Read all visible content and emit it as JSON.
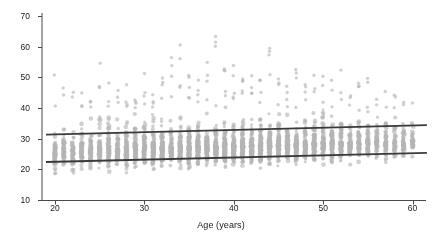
{
  "chart_data": {
    "type": "scatter",
    "title": "",
    "xlabel": "Age (years)",
    "ylabel": "Body mass index (kg/m²)",
    "xlim": [
      18.5,
      61.5
    ],
    "ylim": [
      10,
      71
    ],
    "xticks": [
      20,
      30,
      40,
      50,
      60
    ],
    "xtick_labels": [
      "20",
      "30",
      "40",
      "50",
      "60"
    ],
    "yticks": [
      10,
      20,
      30,
      40,
      50,
      60,
      70
    ],
    "ytick_labels": [
      "10",
      "20",
      "30",
      "40",
      "50",
      "60",
      "70"
    ],
    "grid": false,
    "legend": null,
    "marker": {
      "shape": "circle",
      "color": "#b4b4b4",
      "size_px": 2.0,
      "opacity": 0.62
    },
    "series": [
      {
        "name": "Participants",
        "description": "BMI of individual participants plotted against age in whole years; one vertical column of points per integer age from 20 to 60.",
        "x_grouping": "integer ages 20-60",
        "y_range_observed": [
          14.0,
          65.5
        ],
        "y_dense_band": [
          22.5,
          31.5
        ],
        "points_per_age_column_typical": 95,
        "columns": [
          {
            "age": 20,
            "n": 58,
            "ymin": 16.2,
            "ymax": 53.0,
            "median": 25.6
          },
          {
            "age": 21,
            "n": 54,
            "ymin": 16.4,
            "ymax": 50.1,
            "median": 25.7
          },
          {
            "age": 22,
            "n": 62,
            "ymin": 16.0,
            "ymax": 45.6,
            "median": 25.8
          },
          {
            "age": 23,
            "n": 66,
            "ymin": 15.9,
            "ymax": 47.2,
            "median": 25.9
          },
          {
            "age": 24,
            "n": 70,
            "ymin": 16.1,
            "ymax": 46.0,
            "median": 26.0
          },
          {
            "age": 25,
            "n": 78,
            "ymin": 15.6,
            "ymax": 55.4,
            "median": 26.1
          },
          {
            "age": 26,
            "n": 82,
            "ymin": 15.8,
            "ymax": 49.5,
            "median": 26.2
          },
          {
            "age": 27,
            "n": 88,
            "ymin": 15.4,
            "ymax": 46.9,
            "median": 26.3
          },
          {
            "age": 28,
            "n": 92,
            "ymin": 15.2,
            "ymax": 48.1,
            "median": 26.4
          },
          {
            "age": 29,
            "n": 96,
            "ymin": 15.0,
            "ymax": 45.0,
            "median": 26.4
          },
          {
            "age": 30,
            "n": 104,
            "ymin": 14.8,
            "ymax": 57.0,
            "median": 26.5
          },
          {
            "age": 31,
            "n": 98,
            "ymin": 15.1,
            "ymax": 46.4,
            "median": 26.6
          },
          {
            "age": 32,
            "n": 102,
            "ymin": 14.6,
            "ymax": 51.9,
            "median": 26.7
          },
          {
            "age": 33,
            "n": 108,
            "ymin": 14.2,
            "ymax": 58.3,
            "median": 26.8
          },
          {
            "age": 34,
            "n": 112,
            "ymin": 14.9,
            "ymax": 63.5,
            "median": 26.9
          },
          {
            "age": 35,
            "n": 118,
            "ymin": 15.3,
            "ymax": 50.8,
            "median": 27.0
          },
          {
            "age": 36,
            "n": 114,
            "ymin": 15.0,
            "ymax": 52.6,
            "median": 27.0
          },
          {
            "age": 37,
            "n": 110,
            "ymin": 15.5,
            "ymax": 57.2,
            "median": 27.1
          },
          {
            "age": 38,
            "n": 116,
            "ymin": 14.7,
            "ymax": 64.8,
            "median": 27.2
          },
          {
            "age": 39,
            "n": 120,
            "ymin": 15.2,
            "ymax": 53.4,
            "median": 27.3
          },
          {
            "age": 40,
            "n": 122,
            "ymin": 14.4,
            "ymax": 61.0,
            "median": 27.4
          },
          {
            "age": 41,
            "n": 118,
            "ymin": 15.0,
            "ymax": 49.7,
            "median": 27.4
          },
          {
            "age": 42,
            "n": 114,
            "ymin": 15.4,
            "ymax": 55.1,
            "median": 27.5
          },
          {
            "age": 43,
            "n": 110,
            "ymin": 15.1,
            "ymax": 50.3,
            "median": 27.6
          },
          {
            "age": 44,
            "n": 106,
            "ymin": 14.9,
            "ymax": 63.8,
            "median": 27.7
          },
          {
            "age": 45,
            "n": 104,
            "ymin": 15.6,
            "ymax": 52.0,
            "median": 27.8
          },
          {
            "age": 46,
            "n": 100,
            "ymin": 15.3,
            "ymax": 48.6,
            "median": 27.8
          },
          {
            "age": 47,
            "n": 96,
            "ymin": 15.8,
            "ymax": 54.3,
            "median": 27.9
          },
          {
            "age": 48,
            "n": 92,
            "ymin": 15.5,
            "ymax": 47.8,
            "median": 28.0
          },
          {
            "age": 49,
            "n": 88,
            "ymin": 16.0,
            "ymax": 50.9,
            "median": 28.1
          },
          {
            "age": 50,
            "n": 90,
            "ymin": 15.7,
            "ymax": 55.8,
            "median": 28.2
          },
          {
            "age": 51,
            "n": 84,
            "ymin": 16.2,
            "ymax": 49.1,
            "median": 28.2
          },
          {
            "age": 52,
            "n": 80,
            "ymin": 16.4,
            "ymax": 52.7,
            "median": 28.3
          },
          {
            "age": 53,
            "n": 76,
            "ymin": 16.1,
            "ymax": 46.5,
            "median": 28.4
          },
          {
            "age": 54,
            "n": 72,
            "ymin": 16.6,
            "ymax": 48.9,
            "median": 28.5
          },
          {
            "age": 55,
            "n": 68,
            "ymin": 16.3,
            "ymax": 51.4,
            "median": 28.6
          },
          {
            "age": 56,
            "n": 62,
            "ymin": 16.8,
            "ymax": 45.7,
            "median": 28.6
          },
          {
            "age": 57,
            "n": 56,
            "ymin": 17.0,
            "ymax": 47.3,
            "median": 28.7
          },
          {
            "age": 58,
            "n": 50,
            "ymin": 16.7,
            "ymax": 44.8,
            "median": 28.8
          },
          {
            "age": 59,
            "n": 44,
            "ymin": 17.2,
            "ymax": 46.1,
            "median": 28.9
          },
          {
            "age": 60,
            "n": 38,
            "ymin": 17.4,
            "ymax": 43.9,
            "median": 29.0
          }
        ]
      }
    ],
    "reference_lines": [
      {
        "name": "upper-reference-line",
        "color": "#3a3a3a",
        "width_px": 1.8,
        "x_start": 19.0,
        "x_end": 61.6,
        "y_start": 31.3,
        "y_end": 34.4
      },
      {
        "name": "lower-reference-line",
        "color": "#3a3a3a",
        "width_px": 1.8,
        "x_start": 19.0,
        "x_end": 61.6,
        "y_start": 22.4,
        "y_end": 25.4
      }
    ],
    "axis_color": "#4a4a4a",
    "background": "#ffffff"
  }
}
